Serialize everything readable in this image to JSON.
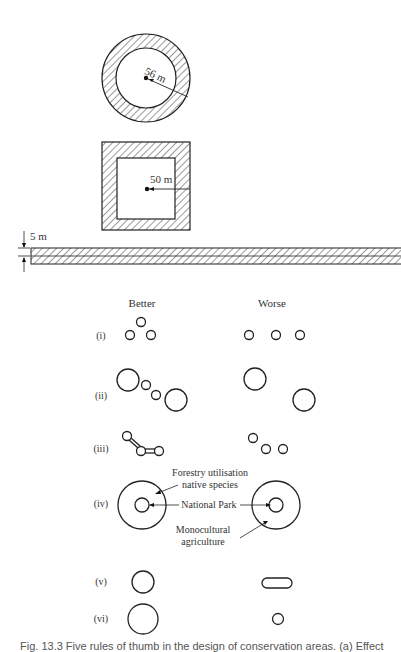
{
  "figure": {
    "top_label": "",
    "shapes_a": {
      "circle_radius_label": "56 m",
      "square_half_label": "50 m",
      "strip_width_label": "5 m"
    },
    "panel_b": {
      "column_headers": {
        "better": "Better",
        "worse": "Worse"
      },
      "rows": [
        {
          "label": "(i)"
        },
        {
          "label": "(ii)"
        },
        {
          "label": "(iii)"
        },
        {
          "label": "(iv)"
        },
        {
          "label": "(v)"
        },
        {
          "label": "(vi)"
        }
      ],
      "annotations": {
        "forestry_line1": "Forestry utilisation",
        "forestry_line2": "native species",
        "national_park": "National Park",
        "mono_line1": "Monocultural",
        "mono_line2": "agriculture"
      }
    },
    "caption": "Fig. 13.3 Five rules of thumb in the design of conservation areas. (a) Effect"
  }
}
